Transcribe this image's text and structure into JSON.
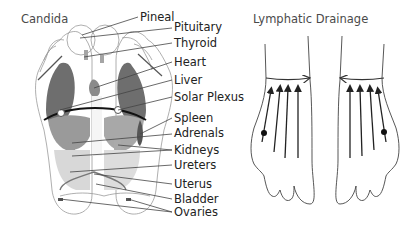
{
  "left_diagram": {
    "title": "Candida",
    "labels": [
      {
        "text": "Pineal",
        "x": 140,
        "y": 21
      },
      {
        "text": "Pituitary",
        "x": 174,
        "y": 31
      },
      {
        "text": "Thyroid",
        "x": 173,
        "y": 47
      },
      {
        "text": "Heart",
        "x": 174,
        "y": 66
      },
      {
        "text": "Liver",
        "x": 174,
        "y": 84
      },
      {
        "text": "Solar Plexus",
        "x": 174,
        "y": 101
      },
      {
        "text": "Spleen",
        "x": 174,
        "y": 122
      },
      {
        "text": "Adrenals",
        "x": 174,
        "y": 137
      },
      {
        "text": "Kidneys",
        "x": 174,
        "y": 154
      },
      {
        "text": "Ureters",
        "x": 174,
        "y": 169
      },
      {
        "text": "Uterus",
        "x": 174,
        "y": 188
      },
      {
        "text": "Bladder",
        "x": 174,
        "y": 203
      },
      {
        "text": "Ovaries",
        "x": 174,
        "y": 216
      }
    ]
  },
  "right_diagram": {
    "title": "Lymphatic Drainage",
    "arrow_direction": "up toward ankle, then lateral across ankle",
    "dot_markers": 2
  },
  "colors": {
    "organ_dark": "#6e6e6e",
    "organ_mid": "#9a9a9a",
    "organ_light": "#d4d4d4",
    "outline": "#9a9a9a",
    "text": "#222222"
  }
}
